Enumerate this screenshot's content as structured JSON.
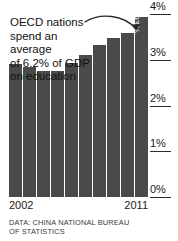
{
  "chart_data": {
    "type": "bar",
    "title": "",
    "subtitle": "",
    "xlabel": "",
    "ylabel": "",
    "categories": [
      "2002",
      "2003",
      "2004",
      "2005",
      "2006",
      "2007",
      "2008",
      "2009",
      "2010",
      "2011"
    ],
    "values": [
      2.9,
      2.85,
      2.75,
      2.75,
      2.93,
      3.1,
      3.32,
      3.48,
      3.58,
      3.93
    ],
    "value_labels": [
      "",
      "",
      "",
      "",
      "",
      "",
      "",
      "",
      "",
      "3.93%"
    ],
    "ylim": [
      0,
      4
    ],
    "ytick_values": [
      0,
      1,
      2,
      3,
      4
    ],
    "ytick_labels": [
      "0%",
      "1%",
      "2%",
      "3%",
      "4%"
    ],
    "axis_position": "right",
    "grid": false,
    "legend": "none",
    "bar_color": "#4a4a4a",
    "visible_xtick_labels": [
      "2002",
      "2011"
    ],
    "annotations": [
      {
        "text": "OECD nations\nspend an average\nof 6.2% of GDP\non education",
        "arrow": "curved-arrow-to-last-bar"
      }
    ],
    "source_note": "DATA: CHINA NATIONAL BUREAU\nOF STATISTICS"
  },
  "axis": {
    "ticks": [
      {
        "label": "4%",
        "value": 4
      },
      {
        "label": "3%",
        "value": 3
      },
      {
        "label": "2%",
        "value": 2
      },
      {
        "label": "1%",
        "value": 1
      },
      {
        "label": "0%",
        "value": 0
      }
    ]
  },
  "x_axis": {
    "first_label": "2002",
    "last_label": "2011"
  },
  "annotation": {
    "text": "OECD nations\nspend an average\nof 6.2% of GDP\non education"
  },
  "highlight": {
    "value_label": "3.93%"
  },
  "footer": {
    "source": "DATA: CHINA NATIONAL BUREAU\nOF STATISTICS"
  },
  "colors": {
    "bar": "#4a4a4a",
    "text": "#1a1a1a",
    "background": "#ffffff"
  }
}
